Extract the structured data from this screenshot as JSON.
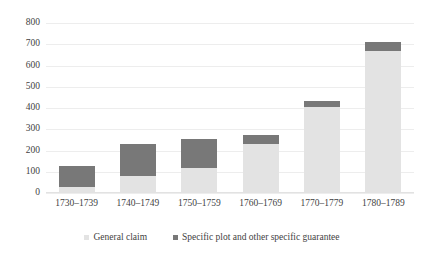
{
  "chart_data": {
    "type": "bar",
    "subtype": "stacked-vertical",
    "title": "",
    "cropped_title_fragment": "",
    "xlabel": "",
    "ylabel": "",
    "ylim": [
      0,
      800
    ],
    "ytick_step": 100,
    "yticks": [
      "800",
      "700",
      "600",
      "500",
      "400",
      "300",
      "200",
      "100",
      "0"
    ],
    "ytick_values": [
      800,
      700,
      600,
      500,
      400,
      300,
      200,
      100,
      0
    ],
    "grid": true,
    "grid_axis": "y",
    "legend_position": "bottom",
    "categories": [
      "1730–1739",
      "1740–1749",
      "1750–1759",
      "1760–1769",
      "1770–1779",
      "1780–1789"
    ],
    "series": [
      {
        "name": "General claim",
        "color": "#e3e3e3",
        "values": [
          30,
          80,
          120,
          230,
          405,
          670
        ]
      },
      {
        "name": "Specific plot and other specific guarantee",
        "color": "#787878",
        "values": [
          98,
          150,
          133,
          45,
          30,
          43
        ]
      }
    ],
    "totals": [
      128,
      230,
      253,
      275,
      435,
      713
    ]
  },
  "legend": {
    "items": [
      {
        "label": "General claim",
        "color": "#e3e3e3"
      },
      {
        "label": "Specific plot and other specific guarantee",
        "color": "#787878"
      }
    ]
  }
}
